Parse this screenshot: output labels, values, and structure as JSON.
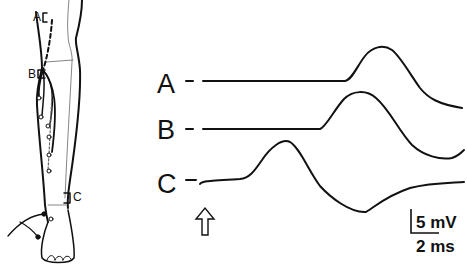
{
  "figure": {
    "leg_diagram": {
      "site_labels": {
        "a": "A",
        "b": "B",
        "c": "C"
      },
      "description": "Lower leg with stimulation sites A, B, C and recording electrodes on foot"
    },
    "traces": [
      {
        "label": "A",
        "name": "trace-a"
      },
      {
        "label": "B",
        "name": "trace-b"
      },
      {
        "label": "C",
        "name": "trace-c"
      }
    ],
    "stimulus_marker": "up-arrow-icon",
    "scale_bar": {
      "amplitude": "5 mV",
      "time": "2 ms"
    }
  }
}
